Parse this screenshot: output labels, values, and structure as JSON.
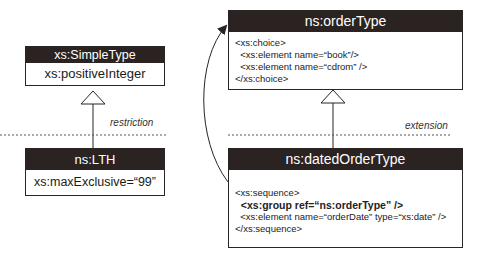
{
  "diagram": {
    "simple_type": {
      "title": "xs:SimpleType",
      "body": "xs:positiveInteger"
    },
    "lth": {
      "title": "ns:LTH",
      "body": "xs:maxExclusive=“99”"
    },
    "restriction_label": "restriction",
    "order_type": {
      "title": "ns:orderType",
      "lines": [
        "<xs:choice>",
        "  <xs:element name=“book”/>",
        "  <xs:element name=“cdrom” />",
        "</xs:choice>"
      ]
    },
    "extension_label": "extension",
    "dated_order_type": {
      "title": "ns:datedOrderType",
      "lines": [
        "<xs:sequence>",
        "  <xs:group ref=“ns:orderType” />",
        "  <xs:element name=“orderDate” type=“xs:date” />",
        "</xs:sequence>"
      ]
    },
    "colors": {
      "header_bg": "#2b2222",
      "header_text": "#ffffff",
      "line": "#2a2424"
    }
  }
}
